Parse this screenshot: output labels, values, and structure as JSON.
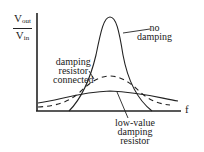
{
  "y_axis": {
    "numerator": "V",
    "numerator_sub": "out",
    "denominator": "V",
    "denominator_sub": "in"
  },
  "x_axis": {
    "label": "f"
  },
  "annotations": {
    "no_damping": [
      "no",
      "damping"
    ],
    "damping_resistor": [
      "damping",
      "resistor",
      "connected"
    ],
    "low_value": [
      "low-value",
      "damping",
      "resistor"
    ]
  },
  "curves": [
    {
      "name": "no damping",
      "style": "solid",
      "peak": "sharp, tall"
    },
    {
      "name": "damping resistor connected",
      "style": "dashed",
      "peak": "moderate"
    },
    {
      "name": "low-value damping resistor",
      "style": "solid",
      "peak": "broad, low"
    }
  ],
  "colors": {
    "line": "#222222",
    "background": "#ffffff"
  }
}
